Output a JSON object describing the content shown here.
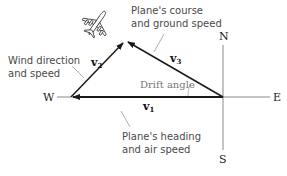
{
  "diagram": {
    "compass": {
      "north": "N",
      "south": "S",
      "east": "E",
      "west": "W"
    },
    "vectors": {
      "v1": {
        "letter": "v",
        "sub": "1"
      },
      "v2": {
        "letter": "v",
        "sub": "2"
      },
      "v3": {
        "letter": "v",
        "sub": "3"
      }
    },
    "labels": {
      "wind_line1": "Wind direction",
      "wind_line2": "and speed",
      "course_line1": "Plane's course",
      "course_line2": "and ground speed",
      "heading_line1": "Plane's heading",
      "heading_line2": "and air speed",
      "drift_angle": "Drift angle"
    },
    "icons": {
      "airplane": "airplane-icon"
    },
    "colors": {
      "vector": "#1a1a1a",
      "axis": "#888888",
      "leader": "#999999",
      "label_text": "#4a4a4a",
      "drift_text": "#777777"
    }
  }
}
